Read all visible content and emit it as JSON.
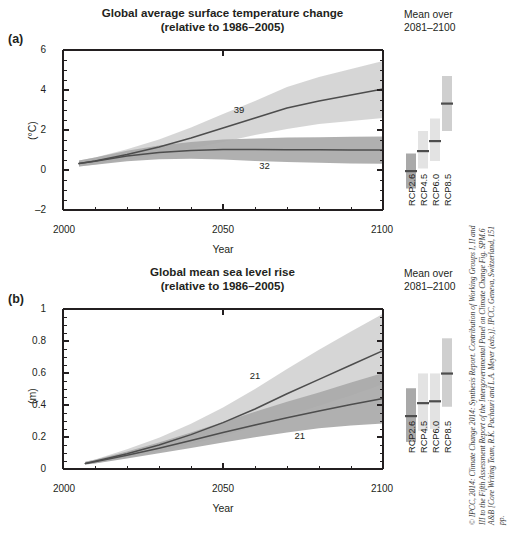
{
  "figure": {
    "credit": "© IPCC, 2014: Climate Change 2014: Synthesis Report. Contribution of Working Groups I, II and III to the Fifth Assessment Report of the Intergovernmental Panel on Climate Change Fig. SPM.6 A&B [Core Writing Team, R.K. Pachauri and L.A. Meyer (eds.)]. IPCC, Geneva, Switzerland, 151 pp."
  },
  "legend": {
    "head_line1": "Mean over",
    "head_line2": "2081–2100",
    "items": [
      {
        "label": "RCP2.6"
      },
      {
        "label": "RCP4.5"
      },
      {
        "label": "RCP6.0"
      },
      {
        "label": "RCP8.5"
      }
    ]
  },
  "panel_a": {
    "letter": "(a)",
    "title_line1": "Global average surface temperature change",
    "title_line2": "(relative to 1986–2005)",
    "xlabel": "Year",
    "ylabel": "(°C)",
    "xticks": [
      "2000",
      "2050",
      "2100"
    ],
    "yticks": [
      "6",
      "4",
      "2",
      "0",
      "–2"
    ],
    "ann_high": "39",
    "ann_low": "32"
  },
  "panel_b": {
    "letter": "(b)",
    "title_line1": "Global mean sea level rise",
    "title_line2": "(relative to 1986–2005)",
    "xlabel": "Year",
    "ylabel": "(m)",
    "xticks": [
      "2000",
      "2050",
      "2100"
    ],
    "yticks": [
      "1",
      "0.8",
      "0.6",
      "0.4",
      "0.2",
      "0"
    ],
    "ann_high": "21",
    "ann_low": "21"
  },
  "colors": {
    "rcp26_band": "#a9a9a9",
    "rcp85_band": "#d2d2d2",
    "line": "#4d4d4d",
    "axis": "#231f20",
    "text": "#231f20"
  },
  "chart_data": [
    {
      "type": "line",
      "id": "panel-a",
      "title": "Global average surface temperature change (relative to 1986–2005)",
      "xlabel": "Year",
      "ylabel": "(°C)",
      "xlim": [
        2000,
        2100
      ],
      "ylim": [
        -2,
        6
      ],
      "xticks": [
        2000,
        2050,
        2100
      ],
      "yticks": [
        -2,
        0,
        2,
        4,
        6
      ],
      "xminor_step": 10,
      "yminor_step": 0.5,
      "grid": false,
      "legend_position": "right",
      "annotations": [
        {
          "text": "39",
          "x": 2055,
          "y": 2.85
        },
        {
          "text": "32",
          "x": 2063,
          "y": 0.05
        }
      ],
      "x": [
        2005,
        2010,
        2020,
        2030,
        2040,
        2050,
        2060,
        2070,
        2080,
        2090,
        2100
      ],
      "series": [
        {
          "name": "RCP8.5",
          "color": "#d2d2d2",
          "values": [
            0.32,
            0.45,
            0.78,
            1.15,
            1.6,
            2.1,
            2.6,
            3.1,
            3.45,
            3.75,
            4.05
          ],
          "lower": [
            0.17,
            0.28,
            0.52,
            0.78,
            1.06,
            1.4,
            1.75,
            2.05,
            2.3,
            2.45,
            2.6
          ],
          "upper": [
            0.47,
            0.62,
            1.04,
            1.52,
            2.12,
            2.8,
            3.45,
            4.15,
            4.65,
            5.05,
            5.45
          ]
        },
        {
          "name": "RCP2.6",
          "color": "#a9a9a9",
          "values": [
            0.32,
            0.44,
            0.7,
            0.88,
            0.98,
            1.02,
            1.02,
            1.01,
            1.01,
            1.0,
            1.0
          ],
          "lower": [
            0.17,
            0.26,
            0.44,
            0.54,
            0.56,
            0.52,
            0.45,
            0.4,
            0.36,
            0.33,
            0.31
          ],
          "upper": [
            0.47,
            0.62,
            0.96,
            1.22,
            1.4,
            1.52,
            1.58,
            1.62,
            1.64,
            1.66,
            1.68
          ]
        }
      ]
    },
    {
      "type": "line",
      "id": "panel-b",
      "title": "Global mean sea level rise (relative to 1986–2005)",
      "xlabel": "Year",
      "ylabel": "(m)",
      "xlim": [
        2000,
        2100
      ],
      "ylim": [
        0,
        1
      ],
      "xticks": [
        2000,
        2050,
        2100
      ],
      "yticks": [
        0,
        0.2,
        0.4,
        0.6,
        0.8,
        1
      ],
      "xminor_step": 10,
      "yminor_step": 0.05,
      "grid": false,
      "legend_position": "right",
      "annotations": [
        {
          "text": "21",
          "x": 2060,
          "y": 0.565
        },
        {
          "text": "21",
          "x": 2074,
          "y": 0.185
        }
      ],
      "x": [
        2007,
        2010,
        2020,
        2030,
        2040,
        2050,
        2060,
        2070,
        2080,
        2090,
        2100
      ],
      "series": [
        {
          "name": "RCP8.5",
          "color": "#d2d2d2",
          "values": [
            0.035,
            0.048,
            0.095,
            0.15,
            0.215,
            0.29,
            0.375,
            0.47,
            0.56,
            0.65,
            0.74
          ],
          "lower": [
            0.028,
            0.036,
            0.07,
            0.11,
            0.155,
            0.205,
            0.265,
            0.33,
            0.395,
            0.46,
            0.53
          ],
          "upper": [
            0.045,
            0.06,
            0.123,
            0.196,
            0.283,
            0.385,
            0.5,
            0.625,
            0.745,
            0.86,
            0.97
          ]
        },
        {
          "name": "RCP2.6",
          "color": "#a9a9a9",
          "values": [
            0.035,
            0.046,
            0.086,
            0.13,
            0.178,
            0.228,
            0.275,
            0.32,
            0.363,
            0.403,
            0.44
          ],
          "lower": [
            0.028,
            0.035,
            0.065,
            0.098,
            0.132,
            0.166,
            0.198,
            0.228,
            0.254,
            0.272,
            0.285
          ],
          "upper": [
            0.045,
            0.058,
            0.11,
            0.165,
            0.228,
            0.294,
            0.358,
            0.42,
            0.478,
            0.54,
            0.6
          ]
        }
      ]
    }
  ],
  "legend_bars": {
    "panel_a": [
      {
        "label": "RCP2.6",
        "low": 0.3,
        "mid": 1.0,
        "high": 1.7,
        "shade": "#a9a9a9"
      },
      {
        "label": "RCP4.5",
        "low": 1.1,
        "mid": 1.8,
        "high": 2.6,
        "shade": "#e3e3e3"
      },
      {
        "label": "RCP6.0",
        "low": 1.4,
        "mid": 2.2,
        "high": 3.1,
        "shade": "#e3e3e3"
      },
      {
        "label": "RCP8.5",
        "low": 2.6,
        "mid": 3.7,
        "high": 4.8,
        "shade": "#cfcfcf"
      }
    ],
    "panel_b": [
      {
        "label": "RCP2.6",
        "low": 0.26,
        "mid": 0.4,
        "high": 0.55,
        "shade": "#a9a9a9"
      },
      {
        "label": "RCP4.5",
        "low": 0.32,
        "mid": 0.47,
        "high": 0.63,
        "shade": "#e3e3e3"
      },
      {
        "label": "RCP6.0",
        "low": 0.33,
        "mid": 0.48,
        "high": 0.63,
        "shade": "#e3e3e3"
      },
      {
        "label": "RCP8.5",
        "low": 0.45,
        "mid": 0.63,
        "high": 0.82,
        "shade": "#cfcfcf"
      }
    ]
  }
}
